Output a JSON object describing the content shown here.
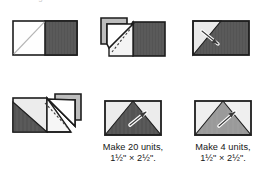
{
  "page": {
    "background": "#ffffff",
    "width": 256,
    "height": 177,
    "top_cut_text": "making the units"
  },
  "palette": {
    "outline": "#1d1d1d",
    "dark_fabric": "#545454",
    "mid_fabric": "#9a9a9a",
    "light_fabric": "#e6e6e6",
    "white_fabric": "#fefefe",
    "shadow_gray": "#bdbdbd",
    "stitch_line": "#3a3a3a",
    "press_arrow": "#ffffff"
  },
  "figures": [
    {
      "id": "step-1",
      "name": "step-1-layout-square-on-rectangle",
      "row": 1,
      "column": 1,
      "description": "Rectangle unit: white square with diagonal drawn line on the left, dark striped rectangle on the right",
      "parts": [
        {
          "name": "white-square-with-marked-diagonal",
          "fill": "#fefefe"
        },
        {
          "name": "dark-striped-rectangle",
          "fill": "#545454"
        },
        {
          "name": "marked-diagonal-line",
          "style": "solid-thin"
        }
      ]
    },
    {
      "id": "step-2",
      "name": "step-2-sew-and-fold-first-corner",
      "row": 1,
      "column": 2,
      "description": "Corner triangle folded back showing dashed stitching line and trimmed-away shadow triangle",
      "parts": [
        {
          "name": "folded-back-triangle-flap",
          "fill": "#ffffff"
        },
        {
          "name": "shadow-triangle",
          "fill": "#bdbdbd"
        },
        {
          "name": "dashed-stitching-line",
          "style": "dashed"
        },
        {
          "name": "dark-striped-rectangle",
          "fill": "#545454"
        }
      ]
    },
    {
      "id": "step-3",
      "name": "step-3-press-first-corner",
      "row": 1,
      "column": 3,
      "description": "Dark unit with light corner triangle pressed open and a press/iron arrow",
      "parts": [
        {
          "name": "dark-striped-background",
          "fill": "#545454"
        },
        {
          "name": "light-corner-triangle",
          "fill": "#e9e9e9"
        },
        {
          "name": "press-arrow-icon",
          "fill": "#ffffff"
        }
      ]
    },
    {
      "id": "step-4",
      "name": "step-4-sew-and-fold-second-corner",
      "row": 2,
      "column": 1,
      "description": "Second corner square sewn, flap folded back with dashed stitching line and shadow triangle",
      "parts": [
        {
          "name": "light-fabric-panel",
          "fill": "#e9e9e9"
        },
        {
          "name": "dark-triangle",
          "fill": "#545454"
        },
        {
          "name": "folded-back-triangle-flap",
          "fill": "#ffffff"
        },
        {
          "name": "shadow-triangle",
          "fill": "#bdbdbd"
        },
        {
          "name": "dashed-stitching-line",
          "style": "dashed"
        }
      ]
    },
    {
      "id": "step-5",
      "name": "step-5-finished-dark-flying-geese-unit",
      "row": 2,
      "column": 2,
      "description": "Finished flying-geese unit with dark center triangle and light corners, press arrow shown",
      "parts": [
        {
          "name": "light-background",
          "fill": "#e9e9e9"
        },
        {
          "name": "dark-center-triangle",
          "fill": "#545454"
        },
        {
          "name": "press-arrow-icon",
          "fill": "#ffffff"
        }
      ],
      "caption_id": "caption-20-units"
    },
    {
      "id": "step-6",
      "name": "step-6-finished-medium-flying-geese-unit",
      "row": 2,
      "column": 3,
      "description": "Finished flying-geese unit with medium-gray center triangle and light corners, press arrow shown",
      "parts": [
        {
          "name": "light-background",
          "fill": "#eeeeee"
        },
        {
          "name": "medium-center-triangle",
          "fill": "#9a9a9a"
        },
        {
          "name": "press-arrow-icon",
          "fill": "#ffffff"
        }
      ],
      "caption_id": "caption-4-units"
    }
  ],
  "captions": {
    "make_20": {
      "line1": "Make 20 units,",
      "line2": "1½\" × 2½\"."
    },
    "make_4": {
      "line1": "Make 4 units,",
      "line2": "1½\" × 2½\"."
    }
  }
}
